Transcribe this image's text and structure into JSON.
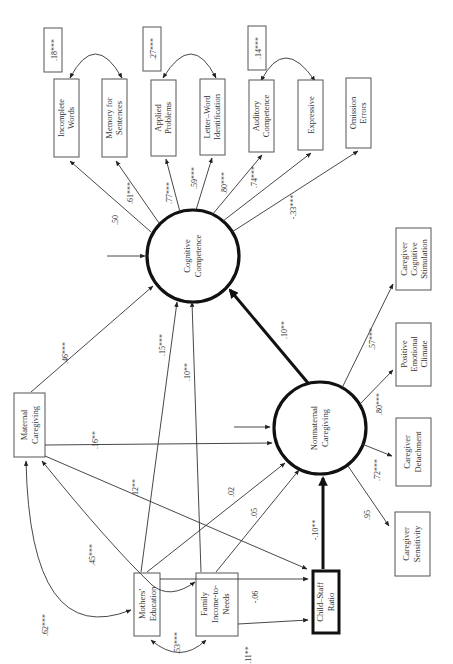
{
  "diagram": {
    "type": "structural-equation-model",
    "orientation": "rotated-90-ccw",
    "latent_variables": {
      "cognitive": {
        "line1": "Cognitive",
        "line2": "Competence"
      },
      "nonmaternal": {
        "line1": "Nonmaternal",
        "line2": "Caregiving"
      }
    },
    "cognitive_indicators": [
      {
        "line1": "Incomplete",
        "line2": "Words",
        "loading": ".50"
      },
      {
        "line1": "Memory for",
        "line2": "Sentences",
        "loading": ".61***"
      },
      {
        "line1": "Applied",
        "line2": "Problems",
        "loading": ".77***"
      },
      {
        "line1": "Letter–Word",
        "line2": "Identification",
        "loading": ".59***"
      },
      {
        "line1": "Auditory",
        "line2": "Competence",
        "loading": ".80***"
      },
      {
        "line1": "Expressive",
        "line2": "",
        "loading": ".74***"
      },
      {
        "line1": "Omission",
        "line2": "Errors",
        "loading": "-.33***"
      }
    ],
    "error_covariances": [
      {
        "between": "Incomplete Words – Memory for Sentences",
        "value": ".18***"
      },
      {
        "between": "Applied Problems – Letter–Word Identification",
        "value": ".27***"
      },
      {
        "between": "Auditory Competence – Expressive",
        "value": ".14***"
      }
    ],
    "nonmaternal_indicators": [
      {
        "line1": "Caregiver",
        "line2": "Cognitive",
        "line3": "Stimulation",
        "loading": ".57***"
      },
      {
        "line1": "Positive",
        "line2": "Emotional",
        "line3": "Climate",
        "loading": ".80***"
      },
      {
        "line1": "Caregiver",
        "line2": "Detachment",
        "line3": "",
        "loading": ".72***"
      },
      {
        "line1": "Caregiver",
        "line2": "Sensitivity",
        "line3": "",
        "loading": ".95"
      }
    ],
    "observed_predictors": {
      "maternal": {
        "line1": "Maternal",
        "line2": "Caregiving"
      },
      "mothers_ed": {
        "line1": "Mothers'",
        "line2": "Education"
      },
      "income": {
        "line1": "Family",
        "line2": "Income-to-",
        "line3": "Needs"
      },
      "ratio": {
        "line1": "Child–Staff",
        "line2": "Ratio"
      }
    },
    "paths": {
      "maternal_to_cognitive": ".46***",
      "maternal_to_nonmaternal": ".16**",
      "maternal_to_ratio": ".12**",
      "mothers_ed_to_cognitive": ".15***",
      "income_to_cognitive": ".10**",
      "mothers_ed_to_nonmaternal": ".02",
      "income_to_nonmaternal": ".05",
      "income_to_ratio": "-.06",
      "mothers_ed_to_ratio": ".11**",
      "nonmaternal_to_cognitive": ".10**",
      "ratio_to_nonmaternal": "-.10**"
    },
    "covariances": {
      "maternal_mothers_ed_outer": ".62***",
      "maternal_mothers_ed_inner": ".45***",
      "mothers_ed_income": ".53***"
    }
  }
}
